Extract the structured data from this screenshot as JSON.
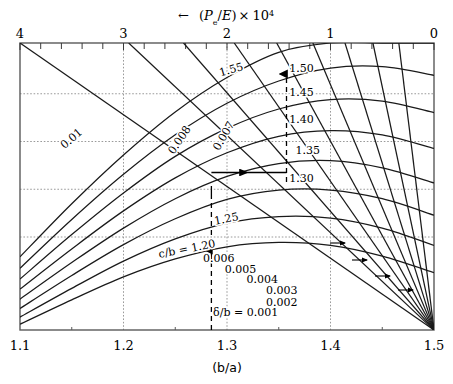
{
  "figure": {
    "top_axis_title": "← (Pₑ/E)× 10⁴",
    "bottom_axis_title": "(b/a)",
    "top_ticks": [
      "4",
      "3",
      "2",
      "1",
      "0"
    ],
    "bottom_ticks": [
      "1.1",
      "1.2",
      "1.3",
      "1.4",
      "1.5"
    ],
    "cb_series_title": "c/b = 1.20",
    "delta_series_title": "δ/b = 0.001",
    "cb_labels": [
      "1.55",
      "1.50",
      "1.45",
      "1.40",
      "1.35",
      "1.30",
      "1.25"
    ],
    "left_labels": [
      "0.01",
      "0.008",
      "0.007"
    ],
    "delta_labels": [
      "0.006",
      "0.005",
      "0.004",
      "0.003",
      "0.002"
    ],
    "colors": {
      "axis": "#555555",
      "curve": "#1a1a1a",
      "grid": "#999999",
      "text": "#000000"
    }
  },
  "chart_data": {
    "type": "line",
    "xlabel": "(b/a)",
    "ylabel": "(Pₑ/E)× 10⁴",
    "xlim": [
      1.1,
      1.5
    ],
    "ylim": [
      0,
      4
    ],
    "y_axis_position": "top",
    "y_axis_direction": "right-to-left",
    "grid": true,
    "grid_style": "dotted",
    "x_major_ticks": [
      1.1,
      1.2,
      1.3,
      1.4,
      1.5
    ],
    "y_major_ticks": [
      4,
      3,
      2,
      1,
      0
    ],
    "y_minor_tick_count_between_majors": 4,
    "legend": "inline-curve-labels",
    "series": [
      {
        "name": "c/b = 1.20",
        "group": "c/b",
        "label": "c/b = 1.20",
        "label_xy": [
          1.262,
          1.08
        ],
        "x": [
          1.1,
          1.15,
          1.2,
          1.25,
          1.3,
          1.35,
          1.4,
          1.45,
          1.5
        ],
        "y": [
          0.08,
          0.42,
          0.74,
          0.99,
          1.16,
          1.22,
          1.18,
          1.03,
          0.8
        ]
      },
      {
        "name": "c/b = 1.25",
        "group": "c/b",
        "label": "1.25",
        "label_xy": [
          1.3,
          1.5
        ],
        "x": [
          1.1,
          1.15,
          1.2,
          1.25,
          1.3,
          1.35,
          1.4,
          1.45,
          1.5
        ],
        "y": [
          0.18,
          0.58,
          0.96,
          1.27,
          1.49,
          1.58,
          1.56,
          1.42,
          1.18
        ]
      },
      {
        "name": "c/b = 1.30",
        "group": "c/b",
        "label": "1.30",
        "label_xy": [
          1.372,
          2.06
        ],
        "x": [
          1.1,
          1.15,
          1.2,
          1.25,
          1.3,
          1.35,
          1.4,
          1.45,
          1.5
        ],
        "y": [
          0.3,
          0.76,
          1.19,
          1.55,
          1.82,
          1.95,
          1.95,
          1.83,
          1.6
        ]
      },
      {
        "name": "c/b = 1.35",
        "group": "c/b",
        "label": "1.35",
        "label_xy": [
          1.378,
          2.46
        ],
        "x": [
          1.1,
          1.15,
          1.2,
          1.25,
          1.3,
          1.35,
          1.4,
          1.45,
          1.5
        ],
        "y": [
          0.43,
          0.94,
          1.42,
          1.83,
          2.14,
          2.32,
          2.36,
          2.26,
          2.05
        ]
      },
      {
        "name": "c/b = 1.40",
        "group": "c/b",
        "label": "1.40",
        "label_xy": [
          1.372,
          2.89
        ],
        "x": [
          1.1,
          1.15,
          1.2,
          1.25,
          1.3,
          1.35,
          1.4,
          1.45,
          1.5
        ],
        "y": [
          0.57,
          1.13,
          1.66,
          2.12,
          2.47,
          2.7,
          2.78,
          2.72,
          2.53
        ]
      },
      {
        "name": "c/b = 1.45",
        "group": "c/b",
        "label": "1.45",
        "label_xy": [
          1.372,
          3.26
        ],
        "x": [
          1.1,
          1.15,
          1.2,
          1.25,
          1.3,
          1.35,
          1.4,
          1.45,
          1.5
        ],
        "y": [
          0.71,
          1.33,
          1.91,
          2.42,
          2.81,
          3.08,
          3.21,
          3.19,
          3.03
        ]
      },
      {
        "name": "c/b = 1.50",
        "group": "c/b",
        "label": "1.50",
        "label_xy": [
          1.372,
          3.6
        ],
        "x": [
          1.1,
          1.15,
          1.2,
          1.25,
          1.3,
          1.35,
          1.4,
          1.45,
          1.5
        ],
        "y": [
          0.86,
          1.54,
          2.17,
          2.72,
          3.16,
          3.47,
          3.65,
          3.67,
          3.55
        ]
      },
      {
        "name": "c/b = 1.55",
        "group": "c/b",
        "label": "1.55",
        "label_xy": [
          1.305,
          3.58
        ],
        "x": [
          1.1,
          1.15,
          1.2,
          1.25,
          1.3,
          1.35,
          1.4,
          1.45,
          1.5
        ],
        "y": [
          1.02,
          1.76,
          2.44,
          3.04,
          3.52,
          3.87,
          4.0,
          4.0,
          4.0
        ]
      },
      {
        "name": "δ/b = 0.01",
        "group": "δ/b",
        "label": "0.01",
        "label_xy": [
          1.152,
          2.63
        ],
        "x": [
          1.1,
          1.5
        ],
        "y": [
          4.0,
          0.0
        ]
      },
      {
        "name": "δ/b = 0.008",
        "group": "δ/b",
        "label": "0.008",
        "label_xy": [
          1.257,
          2.62
        ],
        "x": [
          1.205,
          1.5
        ],
        "y": [
          4.0,
          0.0
        ]
      },
      {
        "name": "δ/b = 0.007",
        "group": "δ/b",
        "label": "0.007",
        "label_xy": [
          1.3,
          2.68
        ],
        "x": [
          1.258,
          1.5
        ],
        "y": [
          4.0,
          0.0
        ]
      },
      {
        "name": "δ/b = 0.006",
        "group": "δ/b",
        "label": "0.006",
        "label_xy": [
          1.292,
          0.95
        ],
        "x": [
          1.307,
          1.5
        ],
        "y": [
          4.0,
          0.0
        ]
      },
      {
        "name": "δ/b = 0.005",
        "group": "δ/b",
        "label": "0.005",
        "label_xy": [
          1.313,
          0.8
        ],
        "x": [
          1.348,
          1.5
        ],
        "y": [
          4.0,
          0.0
        ]
      },
      {
        "name": "δ/b = 0.004",
        "group": "δ/b",
        "label": "0.004",
        "label_xy": [
          1.334,
          0.65
        ],
        "x": [
          1.383,
          1.5
        ],
        "y": [
          4.0,
          0.0
        ]
      },
      {
        "name": "δ/b = 0.003",
        "group": "δ/b",
        "label": "0.003",
        "label_xy": [
          1.353,
          0.5
        ],
        "x": [
          1.414,
          1.5
        ],
        "y": [
          4.0,
          0.0
        ]
      },
      {
        "name": "δ/b = 0.002",
        "group": "δ/b",
        "label": "0.002",
        "label_xy": [
          1.353,
          0.34
        ],
        "x": [
          1.441,
          1.5
        ],
        "y": [
          4.0,
          0.0
        ]
      },
      {
        "name": "δ/b = 0.001",
        "group": "δ/b",
        "label": "δ/b = 0.001",
        "label_xy": [
          1.318,
          0.19
        ],
        "x": [
          1.466,
          1.5
        ],
        "y": [
          4.0,
          0.0
        ]
      }
    ],
    "annotations": [
      {
        "type": "vertical-dashed-line",
        "x": 1.285,
        "y_from": 0.0,
        "y_to": 3.62,
        "arrow": "up"
      },
      {
        "type": "horizontal-arrow",
        "x_from": 1.258,
        "x_to": 1.322,
        "y": 1.95,
        "arrow": "right"
      }
    ]
  }
}
